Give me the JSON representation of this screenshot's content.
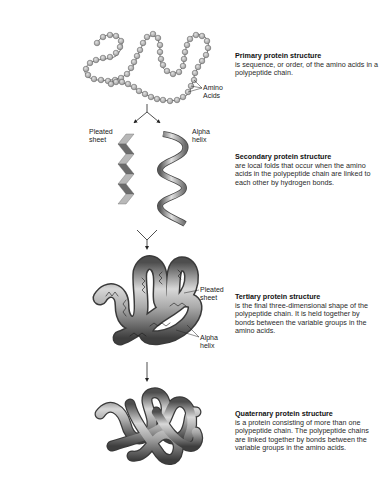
{
  "figure": {
    "stages": [
      {
        "id": "primary",
        "heading": "Primary protein structure",
        "description": "is sequence, or order, of the amino acids in a polypeptide chain.",
        "labels": [
          {
            "line1": "Amino",
            "line2": "Acids"
          }
        ]
      },
      {
        "id": "secondary",
        "heading": "Secondary protein structure",
        "description": "are local folds that occur when the amino acids in the polypeptide chain are linked to each other by hydrogen bonds.",
        "labels": [
          {
            "line1": "Pleated",
            "line2": "sheet"
          },
          {
            "line1": "Alpha",
            "line2": "helix"
          }
        ]
      },
      {
        "id": "tertiary",
        "heading": "Tertiary protein structure",
        "description": "is the final three-dimensional shape of the polypeptide chain. It is held together by bonds between the variable groups in the amino acids.",
        "labels": [
          {
            "line1": "Pleated",
            "line2": "sheet"
          },
          {
            "line1": "Alpha",
            "line2": "helix"
          }
        ]
      },
      {
        "id": "quaternary",
        "heading": "Quaternary protein structure",
        "description": "is a protein consisting of more than one polypeptide chain. The polypeptide chains are linked together by bonds between the variable groups in the amino acids.",
        "labels": []
      }
    ]
  },
  "colors": {
    "bead_fill": "#bdbdbd",
    "bead_stroke": "#555555",
    "sheet_light": "#b5b5b5",
    "sheet_dark": "#6e6e6e",
    "ribbon": "#9a9a9a",
    "line": "#222222"
  }
}
